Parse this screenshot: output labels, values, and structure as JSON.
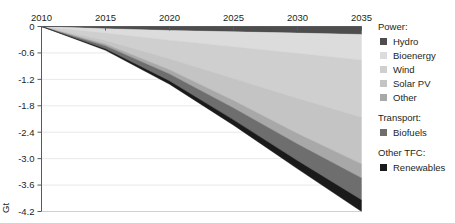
{
  "chart_data": {
    "type": "area",
    "title": "",
    "subtitle": "",
    "xlabel": "",
    "ylabel": "Gt",
    "unit": "Gt",
    "stacked": true,
    "stack_direction": "negative",
    "grid": true,
    "legend_position": "right",
    "x": [
      2010,
      2015,
      2020,
      2025,
      2030,
      2035
    ],
    "xlim": [
      2010,
      2035
    ],
    "ylim": [
      -4.2,
      0
    ],
    "xticks": [
      "2010",
      "2015",
      "2020",
      "2025",
      "2030",
      "2035"
    ],
    "yticks": [
      "0",
      "-0.6",
      "-1.2",
      "-1.8",
      "-2.4",
      "-3.0",
      "-3.6",
      "-4.2"
    ],
    "ytick_values": [
      0,
      -0.6,
      -1.2,
      -1.8,
      -2.4,
      -3.0,
      -3.6,
      -4.2
    ],
    "series": [
      {
        "name": "Hydro",
        "group": "Power",
        "color": "#4d4d4d",
        "values": [
          0,
          -0.05,
          -0.09,
          -0.12,
          -0.15,
          -0.18
        ]
      },
      {
        "name": "Bioenergy",
        "group": "Power",
        "color": "#dcdcdc",
        "values": [
          0,
          -0.1,
          -0.22,
          -0.34,
          -0.46,
          -0.58
        ]
      },
      {
        "name": "Wind",
        "group": "Power",
        "color": "#cfcfcf",
        "values": [
          0,
          -0.17,
          -0.42,
          -0.72,
          -1.02,
          -1.3
        ]
      },
      {
        "name": "Solar PV",
        "group": "Power",
        "color": "#c4c4c4",
        "values": [
          0,
          -0.08,
          -0.25,
          -0.5,
          -0.8,
          -1.06
        ]
      },
      {
        "name": "Other",
        "group": "Power",
        "color": "#a8a8a8",
        "values": [
          0,
          -0.04,
          -0.1,
          -0.17,
          -0.24,
          -0.32
        ]
      },
      {
        "name": "Biofuels",
        "group": "Transport",
        "color": "#6e6e6e",
        "values": [
          0,
          -0.07,
          -0.16,
          -0.27,
          -0.38,
          -0.5
        ]
      },
      {
        "name": "Renewables",
        "group": "Other TFC",
        "color": "#1a1a1a",
        "values": [
          0,
          -0.03,
          -0.07,
          -0.12,
          -0.18,
          -0.26
        ]
      }
    ],
    "totals": [
      0,
      -0.54,
      -1.31,
      -2.24,
      -3.23,
      -4.2
    ]
  },
  "legend": {
    "groups": [
      {
        "heading": "Power:",
        "items": [
          {
            "label": "Hydro",
            "color": "#4d4d4d"
          },
          {
            "label": "Bioenergy",
            "color": "#dcdcdc"
          },
          {
            "label": "Wind",
            "color": "#cfcfcf"
          },
          {
            "label": "Solar PV",
            "color": "#c4c4c4"
          },
          {
            "label": "Other",
            "color": "#a8a8a8"
          }
        ]
      },
      {
        "heading": "Transport:",
        "items": [
          {
            "label": "Biofuels",
            "color": "#6e6e6e"
          }
        ]
      },
      {
        "heading": "Other TFC:",
        "items": [
          {
            "label": "Renewables",
            "color": "#1a1a1a"
          }
        ]
      }
    ]
  }
}
